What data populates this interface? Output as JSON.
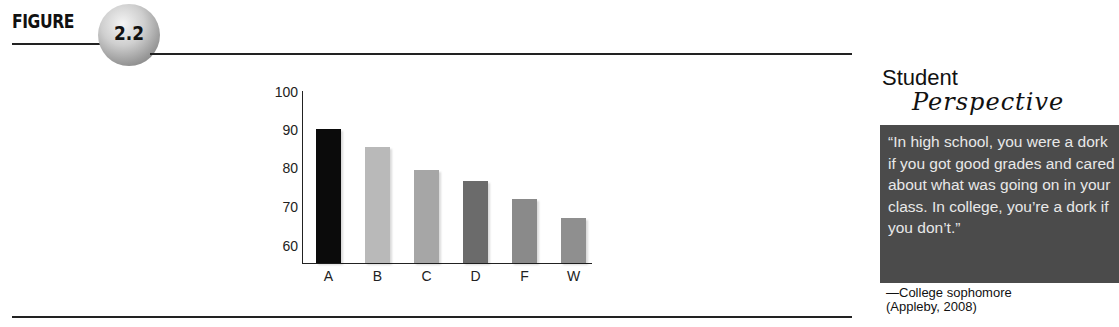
{
  "figure": {
    "label": "FIGURE",
    "number": "2.2"
  },
  "chart_data": {
    "type": "bar",
    "title": "",
    "xlabel": "",
    "ylabel": "",
    "categories": [
      "A",
      "B",
      "C",
      "D",
      "F",
      "W"
    ],
    "values": [
      90.5,
      86,
      80,
      77,
      72.5,
      67.5
    ],
    "ylim": [
      56,
      100
    ],
    "yticks": [
      "100",
      "90",
      "80",
      "70",
      "60"
    ],
    "grid": false,
    "legend": null,
    "bar_colors": [
      "#0b0b0b",
      "#b9b9b9",
      "#a6a6a6",
      "#6b6b6b",
      "#8a8a8a",
      "#8f8f8f"
    ]
  },
  "sidebar": {
    "title_top": "Student",
    "title_script": "Perspective",
    "quote": "“In high school, you were a dork if you got good grades and cared about what was going on in your class. In college, you’re a dork if you don’t.”",
    "attribution_line1": "—College sophomore",
    "attribution_line2": "(Appleby, 2008)"
  }
}
